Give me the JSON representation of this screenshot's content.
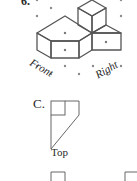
{
  "question": {
    "number": "6.",
    "figure": {
      "type": "isometric-drawing",
      "labels": {
        "front": "Front",
        "right": "Right"
      }
    },
    "option": {
      "letter": "C.",
      "view_label": "Top"
    }
  },
  "colors": {
    "line": "#555555",
    "dot": "#888888",
    "text": "#2a2a2a"
  }
}
